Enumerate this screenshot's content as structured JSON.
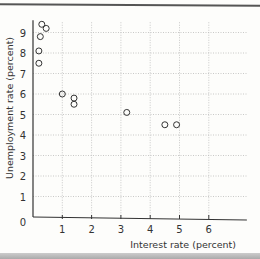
{
  "chart_data": {
    "type": "scatter",
    "title": "",
    "xlabel": "Interest rate (percent)",
    "ylabel": "Unemployment rate (percent)",
    "xlim": [
      0,
      7
    ],
    "ylim": [
      0,
      9.5
    ],
    "x_ticks": [
      "1",
      "2",
      "3",
      "4",
      "5",
      "6"
    ],
    "y_ticks": [
      "0",
      "1",
      "2",
      "3",
      "4",
      "5",
      "6",
      "7",
      "8",
      "9"
    ],
    "grid": true,
    "points": [
      {
        "x": 0.3,
        "y": 9.4
      },
      {
        "x": 0.45,
        "y": 9.2
      },
      {
        "x": 0.25,
        "y": 8.8
      },
      {
        "x": 0.2,
        "y": 8.1
      },
      {
        "x": 0.2,
        "y": 7.5
      },
      {
        "x": 1.0,
        "y": 6.0
      },
      {
        "x": 1.4,
        "y": 5.8
      },
      {
        "x": 1.4,
        "y": 5.5
      },
      {
        "x": 3.2,
        "y": 5.1
      },
      {
        "x": 4.5,
        "y": 4.5
      },
      {
        "x": 4.9,
        "y": 4.5
      }
    ]
  },
  "labels": {
    "xlabel": "Interest rate (percent)",
    "ylabel": "Unemployment rate (percent)",
    "origin": "0"
  }
}
